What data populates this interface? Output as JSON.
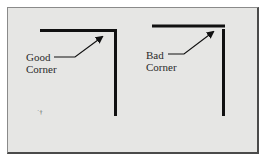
{
  "figure": {
    "background": "#e6e6e4",
    "line_color": "#111111",
    "good_corner": {
      "label_line1": "Good",
      "label_line2": "Corner"
    },
    "bad_corner": {
      "label_line1": "Bad",
      "label_line2": "Corner"
    },
    "small_mark": "˙†"
  }
}
